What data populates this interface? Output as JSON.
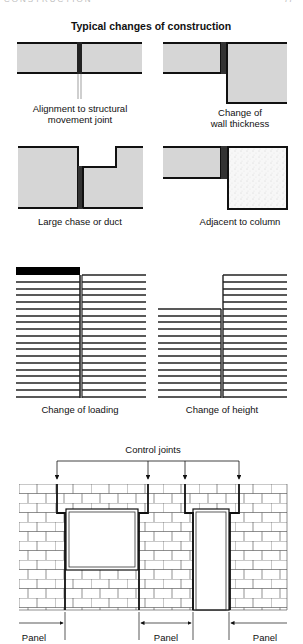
{
  "page_header": {
    "left": "CONSTRUCTION",
    "right": "77"
  },
  "title": "Typical changes of construction",
  "panels": [
    {
      "id": "movement-joint",
      "caption_lines": [
        "Alignment to structural",
        "movement joint"
      ]
    },
    {
      "id": "wall-thickness",
      "caption_lines": [
        "Change of",
        "wall thickness"
      ]
    },
    {
      "id": "chase-duct",
      "caption_lines": [
        "Large chase or duct"
      ]
    },
    {
      "id": "column",
      "caption_lines": [
        "Adjacent to column"
      ]
    },
    {
      "id": "loading",
      "caption_lines": [
        "Change of loading"
      ]
    },
    {
      "id": "height",
      "caption_lines": [
        "Change of height"
      ]
    }
  ],
  "wall_elevation": {
    "control_joints_label": "Control joints",
    "panel_labels": [
      "Panel",
      "Panel",
      "Panel"
    ]
  },
  "colors": {
    "block_fill": "#d6d6d6",
    "stroke": "#111111",
    "joint": "#333333"
  }
}
